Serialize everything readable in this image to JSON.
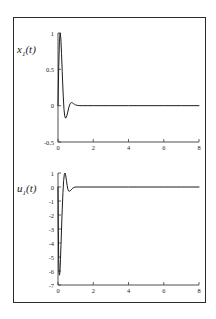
{
  "figure": {
    "frame_color": "#2b2b2b",
    "background": "#ffffff",
    "curve_color": "#1d1d1d"
  },
  "chart_data": [
    {
      "type": "line",
      "id": "upper",
      "title": "",
      "ylabel": "x₁(t)",
      "xlabel": "",
      "xlim": [
        0,
        8
      ],
      "ylim": [
        -0.5,
        1
      ],
      "grid": false,
      "legend": null,
      "xticks": [
        0,
        2,
        4,
        6,
        8
      ],
      "xticklabels": [
        "0",
        "2",
        "4",
        "6",
        "8"
      ],
      "yticks": [
        -0.5,
        0,
        0.5,
        1
      ],
      "yticklabels": [
        "-0.5",
        "0",
        "0.5",
        "1"
      ],
      "series": [
        {
          "name": "x1",
          "x": [
            0.0,
            0.04,
            0.08,
            0.12,
            0.16,
            0.2,
            0.24,
            0.26,
            0.3,
            0.34,
            0.38,
            0.42,
            0.46,
            0.5,
            0.54,
            0.58,
            0.62,
            0.66,
            0.7,
            0.76,
            0.82,
            0.88,
            0.94,
            1.0,
            1.1,
            1.2,
            1.4,
            1.7,
            2.0,
            3.0,
            4.0,
            5.0,
            6.0,
            7.0,
            8.0
          ],
          "y": [
            0.0,
            0.52,
            0.88,
            1.0,
            0.93,
            0.72,
            0.47,
            0.34,
            0.12,
            -0.05,
            -0.14,
            -0.17,
            -0.165,
            -0.14,
            -0.1,
            -0.06,
            -0.02,
            0.01,
            0.032,
            0.042,
            0.038,
            0.028,
            0.018,
            0.01,
            0.004,
            0.001,
            0.0,
            0.0,
            0.0,
            0.0,
            0.0,
            0.0,
            0.0,
            0.0,
            0.0
          ]
        }
      ]
    },
    {
      "type": "line",
      "id": "lower",
      "title": "",
      "ylabel": "u₁(t)",
      "xlabel": "",
      "xlim": [
        0,
        8
      ],
      "ylim": [
        -7,
        1
      ],
      "grid": false,
      "legend": null,
      "xticks": [
        0,
        2,
        4,
        6,
        8
      ],
      "xticklabels": [
        "0",
        "2",
        "4",
        "6",
        "8"
      ],
      "yticks": [
        -7,
        -6,
        -5,
        -4,
        -3,
        -2,
        -1,
        0,
        1
      ],
      "yticklabels": [
        "-7",
        "-6",
        "-5",
        "-4",
        "-3",
        "-2",
        "-1",
        "0",
        "1"
      ],
      "series": [
        {
          "name": "u1",
          "x": [
            0.0,
            0.02,
            0.04,
            0.06,
            0.08,
            0.1,
            0.12,
            0.14,
            0.17,
            0.2,
            0.24,
            0.28,
            0.32,
            0.36,
            0.4,
            0.44,
            0.48,
            0.52,
            0.56,
            0.6,
            0.66,
            0.72,
            0.78,
            0.84,
            0.9,
            0.96,
            1.02,
            1.1,
            1.2,
            1.35,
            1.6,
            2.0,
            3.0,
            4.0,
            5.0,
            6.0,
            7.0,
            8.0
          ],
          "y": [
            0.0,
            -3.1,
            -5.2,
            -6.1,
            -6.3,
            -6.2,
            -5.8,
            -5.2,
            -4.1,
            -3.0,
            -1.6,
            -0.4,
            0.45,
            0.9,
            1.0,
            0.8,
            0.45,
            0.1,
            -0.16,
            -0.28,
            -0.3,
            -0.24,
            -0.15,
            -0.08,
            -0.035,
            -0.012,
            -0.004,
            0.0,
            0.0,
            0.0,
            0.0,
            0.0,
            0.0,
            0.0,
            0.0,
            0.0,
            0.0,
            0.0
          ]
        }
      ]
    }
  ]
}
